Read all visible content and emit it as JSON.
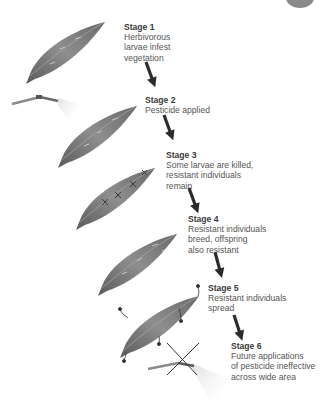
{
  "diagram": {
    "type": "process-flow",
    "stages": [
      {
        "title": "Stage 1",
        "description": "Herbivorous\nlarvae infest\nvegetation"
      },
      {
        "title": "Stage 2",
        "description": "Pesticide applied"
      },
      {
        "title": "Stage 3",
        "description": "Some larvae are killed,\nresistant individuals\nremain"
      },
      {
        "title": "Stage 4",
        "description": "Resistant individuals\nbreed, offspring\nalso resistant"
      },
      {
        "title": "Stage 5",
        "description": "Resistant individuals\nspread"
      },
      {
        "title": "Stage 6",
        "description": "Future applications\nof pesticide ineffective\nacross wide area"
      }
    ],
    "icons": {
      "leaf": "leaf-icon",
      "sprayer": "pesticide-sprayer-icon",
      "arrow": "down-arrow-icon",
      "cross": "crossed-out-icon",
      "larva": "larva-icon"
    },
    "colors": {
      "leaf_dark": "#4f4f4f",
      "leaf_light": "#9a9a9a",
      "arrow": "#2b2b2b",
      "text": "#555555",
      "title": "#3a3a3a"
    }
  }
}
